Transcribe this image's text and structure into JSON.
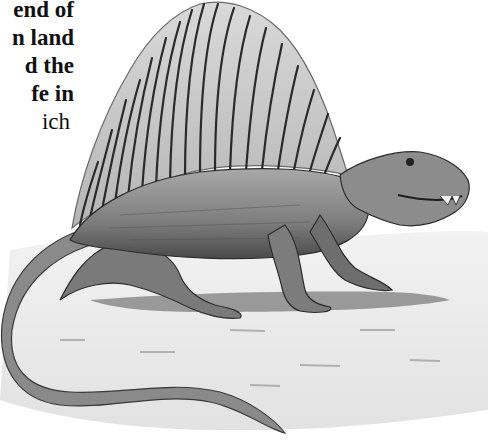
{
  "page": {
    "text_fragment": {
      "lines": [
        {
          "text": "end of",
          "weight": "bold"
        },
        {
          "text": "n land",
          "weight": "bold"
        },
        {
          "text": "d the",
          "weight": "bold"
        },
        {
          "text": "fe in",
          "weight": "bold"
        },
        {
          "text": "ich",
          "weight": "regular"
        }
      ]
    },
    "illustration": {
      "subject": "Dimetrodon (sail-backed reptile) pencil illustration",
      "style": "grayscale graphite drawing",
      "colors": {
        "background": "#ffffff",
        "ink": "#1a1a1a",
        "sail": "#c9c9c9",
        "body": "#8f8f8f",
        "ground": "#e6e6e6"
      }
    }
  }
}
